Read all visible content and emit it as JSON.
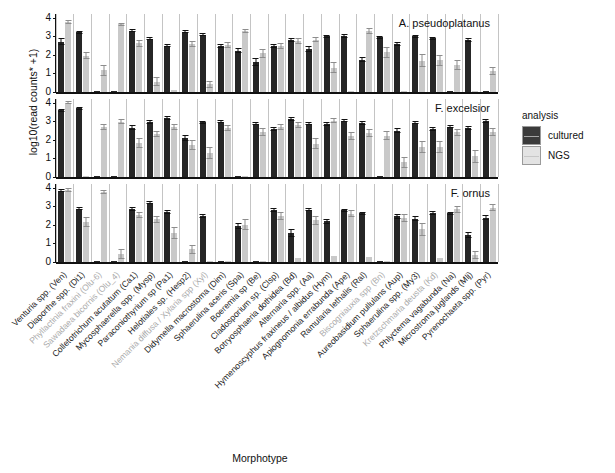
{
  "chart_data": {
    "type": "bar",
    "title": "",
    "xlabel": "Morphotype",
    "ylabel": "log10(read counts* +1)",
    "ylim": [
      0,
      4.2
    ],
    "yticks": [
      0,
      1,
      2,
      3,
      4
    ],
    "grid": false,
    "legend": {
      "title": "analysis",
      "position": "right",
      "entries": [
        {
          "name": "cultured",
          "color": "#3b3b3b"
        },
        {
          "name": "NGS",
          "color": "#e3e3e3"
        }
      ]
    },
    "facets": [
      "A. pseudoplatanus",
      "F. excelsior",
      "F. ornus"
    ],
    "categories": [
      "Venturia spp. (Ven)",
      "Diaporthe spp. (Di1)",
      "Phyllactinia fraxini (Olu-6)",
      "Sawadaea bicornis (Olu_4)",
      "Colletotrichum acutatum (Ca1)",
      "Mycosphaerella spp. (Mysp)",
      "Paraconiothyrium sp (Pa1)",
      "Helotiales sp. (Hesp2)",
      "Nemania diffusa / Xylaria spp (Xyl)",
      "Didymella macrostoma (Dim)",
      "Sphaerulina aceris (Spa)",
      "Boeremia sp (Be)",
      "Cladosporium sp. (Clsp)",
      "Botryosphaeria dothidea (Bd)",
      "Alternaria spp. (Aa)",
      "Hymenoscyphus fraxineus / albidus (Hym)",
      "Apiognomonia errabunda (Ape)",
      "Ramularia lethalis (Ral)",
      "Biscogniauxia spp (Bn)",
      "Aureobasidium pullulans (Aup)",
      "Sphaerulina spp. (My3)",
      "Kretzschmaria deusta (Kd)",
      "Phlyctema vagabunda (Na)",
      "Microstroma juglands (Mlj)",
      "Pyrenochaeta spp. (Pyr)"
    ],
    "categories_faint": [
      2,
      3,
      8,
      18,
      21
    ],
    "series": [
      {
        "facet": "A. pseudoplatanus",
        "name": "cultured",
        "values": [
          2.72,
          3.22,
          0.05,
          0.05,
          3.3,
          2.88,
          2.5,
          3.24,
          3.08,
          2.5,
          2.22,
          1.6,
          2.46,
          2.8,
          2.3,
          3.0,
          3.02,
          1.75,
          2.95,
          2.6,
          3.0,
          2.9,
          0.02,
          2.8,
          0.02
        ],
        "errors": [
          0.17,
          0.08,
          0.02,
          0.02,
          0.08,
          0.1,
          0.09,
          0.08,
          0.09,
          0.11,
          0.14,
          0.22,
          0.1,
          0.09,
          0.16,
          0.09,
          0.09,
          0.15,
          0.08,
          0.1,
          0.08,
          0.09,
          0.01,
          0.09,
          0.01
        ]
      },
      {
        "facet": "A. pseudoplatanus",
        "name": "NGS",
        "values": [
          3.78,
          1.96,
          1.16,
          3.64,
          2.62,
          0.55,
          0.1,
          2.58,
          0.42,
          2.52,
          3.28,
          2.08,
          2.46,
          2.75,
          2.82,
          1.32,
          0.08,
          3.3,
          2.15,
          0.05,
          1.68,
          1.72,
          1.45,
          0.05,
          1.12
        ],
        "errors": [
          0.1,
          0.18,
          0.28,
          0.1,
          0.17,
          0.24,
          0.06,
          0.17,
          0.2,
          0.16,
          0.1,
          0.26,
          0.16,
          0.15,
          0.15,
          0.3,
          0.05,
          0.16,
          0.3,
          0.03,
          0.35,
          0.3,
          0.28,
          0.03,
          0.22
        ]
      },
      {
        "facet": "F. excelsior",
        "name": "cultured",
        "values": [
          3.6,
          3.7,
          0.05,
          0.05,
          2.66,
          2.96,
          3.16,
          2.1,
          2.95,
          2.98,
          0.05,
          2.88,
          2.58,
          3.12,
          2.88,
          2.86,
          3.04,
          2.92,
          0.05,
          2.5,
          2.92,
          2.58,
          2.72,
          2.62,
          3.02
        ],
        "errors": [
          0.09,
          0.08,
          0.02,
          0.02,
          0.12,
          0.09,
          0.1,
          0.15,
          0.09,
          0.09,
          0.02,
          0.1,
          0.12,
          0.09,
          0.1,
          0.1,
          0.09,
          0.1,
          0.02,
          0.14,
          0.09,
          0.12,
          0.1,
          0.11,
          0.09
        ]
      },
      {
        "facet": "F. excelsior",
        "name": "NGS",
        "values": [
          4.0,
          0.05,
          2.7,
          2.98,
          1.82,
          2.32,
          2.7,
          1.72,
          1.28,
          2.62,
          0.05,
          2.42,
          2.7,
          2.8,
          1.8,
          3.04,
          2.22,
          2.35,
          2.22,
          0.8,
          1.6,
          1.62,
          2.4,
          1.12,
          2.42
        ],
        "errors": [
          0.09,
          0.02,
          0.17,
          0.12,
          0.27,
          0.17,
          0.17,
          0.28,
          0.32,
          0.16,
          0.02,
          0.2,
          0.16,
          0.14,
          0.28,
          0.12,
          0.22,
          0.22,
          0.24,
          0.3,
          0.32,
          0.3,
          0.2,
          0.35,
          0.2
        ]
      },
      {
        "facet": "F. ornus",
        "name": "cultured",
        "values": [
          3.84,
          2.88,
          0.05,
          0.05,
          2.84,
          3.2,
          2.68,
          0.05,
          2.48,
          0.02,
          1.96,
          0.05,
          2.82,
          1.56,
          2.82,
          2.2,
          2.78,
          2.62,
          0.05,
          2.46,
          2.34,
          2.64,
          2.62,
          1.46,
          2.38
        ],
        "errors": [
          0.09,
          0.1,
          0.02,
          0.02,
          0.1,
          0.08,
          0.1,
          0.02,
          0.12,
          0.01,
          0.16,
          0.02,
          0.1,
          0.2,
          0.09,
          0.14,
          0.09,
          0.1,
          0.02,
          0.13,
          0.14,
          0.11,
          0.1,
          0.18,
          0.13
        ]
      },
      {
        "facet": "F. ornus",
        "name": "NGS",
        "values": [
          3.86,
          2.15,
          3.78,
          0.42,
          2.55,
          2.3,
          1.58,
          0.68,
          0.05,
          0.08,
          2.0,
          0.05,
          2.48,
          0.2,
          2.25,
          0.3,
          2.6,
          0.28,
          0.05,
          2.38,
          1.76,
          0.2,
          2.84,
          0.38,
          2.92
        ],
        "errors": [
          0.1,
          0.26,
          0.1,
          0.26,
          0.17,
          0.2,
          0.32,
          0.24,
          0.03,
          0.05,
          0.3,
          0.03,
          0.2,
          0.18,
          0.25,
          0.18,
          0.18,
          0.18,
          0.03,
          0.22,
          0.34,
          0.16,
          0.2,
          0.22,
          0.18
        ]
      }
    ]
  }
}
